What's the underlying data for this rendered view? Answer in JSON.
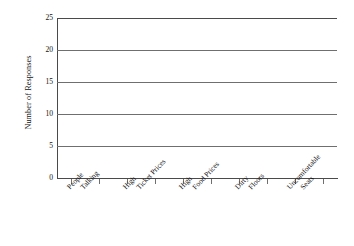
{
  "chart_data": {
    "type": "bar",
    "title": "",
    "subtitle": "",
    "xlabel": "",
    "ylabel": "Number of Responses",
    "categories": [
      "People Talking",
      "High Ticket Prices",
      "High Food Prices",
      "Dirty Floors",
      "Uncomfortable Seats"
    ],
    "category_lines": [
      [
        "People",
        "Talking"
      ],
      [
        "High",
        "Ticket Prices"
      ],
      [
        "High",
        "Food Prices"
      ],
      [
        "Dirty",
        "Floors"
      ],
      [
        "Uncomfortable",
        "Seats"
      ]
    ],
    "values": [
      0,
      0,
      0,
      0,
      0
    ],
    "ylim": [
      0,
      25
    ],
    "ytick_values": [
      0,
      5,
      10,
      15,
      20,
      25
    ],
    "ytick_labels": [
      "0",
      "5",
      "10",
      "15",
      "20",
      "25"
    ],
    "grid": true,
    "legend": false,
    "legend_position": "none",
    "note": "blank chart template; no bars plotted"
  },
  "style": {
    "background": "#ffffff",
    "gridline_color": "#6f6f6f",
    "axis_color": "#4a4a4a",
    "text_color": "#111111"
  }
}
